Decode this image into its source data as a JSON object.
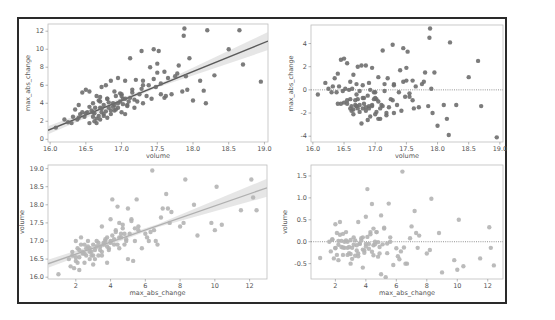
{
  "figure": {
    "frame_color": "#2a2a2a",
    "point_color_dark": "#6e6e6e",
    "point_color_light": "#b4b4b4",
    "line_color_dark": "#5a5a5a",
    "line_color_light": "#b0b0b0"
  },
  "chart_data": [
    {
      "id": "top-left",
      "type": "scatter",
      "subtype": "regplot",
      "xlabel": "volume",
      "ylabel": "max_abs_change",
      "xlim": [
        15.97,
        19.05
      ],
      "ylim": [
        -0.3,
        12.8
      ],
      "xticks": [
        16.0,
        16.5,
        17.0,
        17.5,
        18.0,
        18.5,
        19.0
      ],
      "xtick_labels": [
        "16.0",
        "16.5",
        "17.0",
        "17.5",
        "18.0",
        "18.5",
        "19.0"
      ],
      "yticks": [
        0,
        2,
        4,
        6,
        8,
        10,
        12
      ],
      "ytick_labels": [
        "0",
        "2",
        "4",
        "6",
        "8",
        "10",
        "12"
      ],
      "regression": {
        "x": [
          15.97,
          19.05
        ],
        "y": [
          1.0,
          10.9
        ],
        "ci": true
      },
      "points_x": [
        16.08,
        16.2,
        16.25,
        16.3,
        16.32,
        16.35,
        16.38,
        16.4,
        16.42,
        16.45,
        16.48,
        16.5,
        16.52,
        16.55,
        16.55,
        16.58,
        16.6,
        16.6,
        16.62,
        16.63,
        16.65,
        16.65,
        16.68,
        16.7,
        16.7,
        16.72,
        16.72,
        16.75,
        16.75,
        16.78,
        16.8,
        16.8,
        16.82,
        16.85,
        16.85,
        16.88,
        16.9,
        16.9,
        16.92,
        16.95,
        16.95,
        16.98,
        17.0,
        17.0,
        17.02,
        17.05,
        17.05,
        17.08,
        17.1,
        17.12,
        17.15,
        17.18,
        17.2,
        17.22,
        17.25,
        17.28,
        17.3,
        17.3,
        17.35,
        17.38,
        17.4,
        17.42,
        17.45,
        17.48,
        17.5,
        17.52,
        17.55,
        17.6,
        17.62,
        17.65,
        17.7,
        17.75,
        17.78,
        17.8,
        17.85,
        17.87,
        17.88,
        17.9,
        17.92,
        17.95,
        18.0,
        18.1,
        18.15,
        18.18,
        18.2,
        18.3,
        18.5,
        18.65,
        18.7,
        18.95,
        16.45,
        16.6,
        16.7,
        16.8,
        16.9,
        17.0,
        16.65,
        16.75,
        16.85,
        16.95,
        17.05,
        16.55,
        16.62,
        16.72,
        16.82,
        16.92,
        17.02,
        17.12,
        16.68,
        16.78,
        16.88,
        16.98,
        17.08,
        17.18,
        17.28,
        16.4,
        16.5,
        16.7,
        17.15,
        17.3,
        17.45,
        17.5,
        17.55,
        17.6
      ],
      "points_y": [
        1.3,
        2.2,
        1.9,
        1.8,
        2.5,
        3.3,
        2.2,
        3.8,
        2.8,
        5.2,
        2.5,
        5.5,
        3.0,
        1.8,
        5.3,
        3.2,
        2.5,
        4.0,
        2.0,
        3.5,
        1.8,
        4.8,
        2.6,
        2.2,
        4.2,
        5.8,
        3.0,
        2.6,
        3.8,
        6.0,
        2.4,
        4.5,
        3.5,
        2.8,
        6.5,
        4.0,
        3.2,
        5.3,
        4.8,
        3.5,
        6.8,
        4.2,
        3.0,
        5.0,
        4.5,
        2.8,
        6.5,
        3.8,
        4.2,
        9.0,
        5.5,
        3.5,
        6.6,
        4.2,
        5.0,
        9.8,
        4.0,
        6.5,
        4.8,
        6.0,
        8.0,
        4.5,
        10.0,
        5.8,
        8.4,
        9.8,
        6.2,
        7.5,
        4.8,
        6.8,
        5.0,
        7.0,
        7.3,
        8.2,
        5.3,
        11.5,
        12.3,
        7.0,
        5.5,
        9.0,
        4.3,
        6.5,
        5.4,
        4.0,
        12.1,
        7.1,
        10.0,
        12.1,
        8.3,
        6.4,
        3.0,
        3.0,
        3.5,
        4.5,
        3.8,
        4.8,
        2.3,
        2.8,
        3.2,
        4.0,
        4.5,
        3.6,
        2.9,
        3.4,
        4.1,
        3.3,
        3.9,
        4.6,
        4.3,
        3.1,
        3.6,
        5.1,
        3.7,
        4.4,
        5.6,
        2.4,
        2.9,
        4.7,
        5.2,
        6.0,
        6.7,
        7.4,
        5.0,
        4.6
      ]
    },
    {
      "id": "top-right",
      "type": "scatter",
      "subtype": "residplot",
      "xlabel": "volume",
      "ylabel": "max_abs_change",
      "xlim": [
        15.97,
        19.05
      ],
      "ylim": [
        -4.5,
        5.6
      ],
      "xticks": [
        16.0,
        16.5,
        17.0,
        17.5,
        18.0,
        18.5,
        19.0
      ],
      "xtick_labels": [
        "16.0",
        "16.5",
        "17.0",
        "17.5",
        "18.0",
        "18.5",
        "19.0"
      ],
      "yticks": [
        -4,
        -2,
        0,
        2,
        4
      ],
      "ytick_labels": [
        "-4",
        "-2",
        "0",
        "2",
        "4"
      ],
      "zero_line": 0,
      "points_x": [
        16.08,
        16.2,
        16.25,
        16.3,
        16.32,
        16.35,
        16.38,
        16.4,
        16.42,
        16.45,
        16.48,
        16.5,
        16.52,
        16.55,
        16.55,
        16.58,
        16.6,
        16.6,
        16.62,
        16.63,
        16.65,
        16.65,
        16.68,
        16.7,
        16.7,
        16.72,
        16.72,
        16.75,
        16.75,
        16.78,
        16.8,
        16.8,
        16.82,
        16.85,
        16.85,
        16.88,
        16.9,
        16.9,
        16.92,
        16.95,
        16.95,
        16.98,
        17.0,
        17.0,
        17.02,
        17.05,
        17.05,
        17.08,
        17.1,
        17.12,
        17.15,
        17.18,
        17.2,
        17.22,
        17.25,
        17.28,
        17.3,
        17.3,
        17.35,
        17.38,
        17.4,
        17.42,
        17.45,
        17.48,
        17.5,
        17.52,
        17.55,
        17.6,
        17.62,
        17.65,
        17.7,
        17.75,
        17.78,
        17.8,
        17.85,
        17.87,
        17.88,
        17.9,
        17.92,
        17.95,
        18.0,
        18.1,
        18.15,
        18.18,
        18.2,
        18.3,
        18.5,
        18.65,
        18.7,
        18.95,
        16.45,
        16.6,
        16.7,
        16.8,
        16.9,
        17.0,
        16.65,
        16.75,
        16.85,
        16.95,
        17.05,
        16.55,
        16.62,
        16.72,
        16.82,
        16.92,
        17.02,
        17.12,
        16.68,
        16.78,
        16.88,
        16.98,
        17.08,
        17.18,
        17.28,
        16.4,
        16.5,
        16.7,
        17.15,
        17.3,
        17.45,
        17.5,
        17.55,
        17.6
      ],
      "points_y": [
        -0.4,
        0.6,
        0.1,
        -0.2,
        0.3,
        1.0,
        -0.2,
        1.4,
        0.3,
        2.6,
        -0.1,
        2.7,
        0.1,
        -1.2,
        2.3,
        0.0,
        -0.8,
        0.7,
        -1.4,
        0.1,
        -1.7,
        1.3,
        -0.9,
        -1.4,
        0.5,
        2.0,
        -0.8,
        -1.3,
        -0.1,
        2.1,
        -1.6,
        0.4,
        -0.7,
        -1.5,
        2.1,
        -0.5,
        -1.4,
        0.6,
        0.0,
        -1.4,
        1.9,
        -0.8,
        -2.1,
        -0.2,
        -0.8,
        -2.5,
        1.1,
        -1.6,
        -1.3,
        3.4,
        -0.1,
        -2.2,
        1.0,
        -1.5,
        -0.8,
        3.9,
        -2.0,
        0.5,
        -1.3,
        -0.2,
        1.7,
        -1.8,
        3.6,
        -0.6,
        1.9,
        3.3,
        -0.3,
        0.8,
        -1.6,
        0.3,
        -1.5,
        0.5,
        0.7,
        1.5,
        -1.4,
        4.5,
        5.3,
        0.1,
        -2.0,
        1.5,
        -3.1,
        -1.3,
        -2.5,
        -3.9,
        4.1,
        -1.3,
        1.1,
        2.5,
        -1.4,
        -4.1,
        -1.2,
        -1.6,
        -1.4,
        -0.7,
        -1.6,
        -0.7,
        -2.1,
        -1.9,
        -1.8,
        -1.3,
        -1.0,
        -0.9,
        -1.8,
        -1.6,
        -1.2,
        -2.3,
        -1.9,
        -1.4,
        -1.3,
        -2.9,
        -2.6,
        -0.2,
        -2.5,
        -2.0,
        -0.9,
        -1.2,
        -1.1,
        -0.4,
        0.5,
        0.4,
        0.7,
        0.8,
        -0.6,
        -0.9
      ]
    },
    {
      "id": "bottom-left",
      "type": "scatter",
      "subtype": "regplot",
      "xlabel": "max_abs_change",
      "ylabel": "volume",
      "xlim": [
        0.4,
        13.0
      ],
      "ylim": [
        15.95,
        19.1
      ],
      "xticks": [
        2,
        4,
        6,
        8,
        10,
        12
      ],
      "xtick_labels": [
        "2",
        "4",
        "6",
        "8",
        "10",
        "12"
      ],
      "yticks": [
        16.0,
        16.5,
        17.0,
        17.5,
        18.0,
        18.5,
        19.0
      ],
      "ytick_labels": [
        "16.0",
        "16.5",
        "17.0",
        "17.5",
        "18.0",
        "18.5",
        "19.0"
      ],
      "regression": {
        "x": [
          0.4,
          13.0
        ],
        "y": [
          16.37,
          18.47
        ],
        "ci": true
      },
      "points_x": [
        1.0,
        1.6,
        1.7,
        1.8,
        1.9,
        2.0,
        2.0,
        2.1,
        2.2,
        2.2,
        2.3,
        2.4,
        2.5,
        2.5,
        2.6,
        2.7,
        2.8,
        2.8,
        2.9,
        3.0,
        3.0,
        3.1,
        3.2,
        3.3,
        3.4,
        3.5,
        3.5,
        3.6,
        3.7,
        3.8,
        3.8,
        3.9,
        4.0,
        4.0,
        4.1,
        4.2,
        4.3,
        4.4,
        4.5,
        4.5,
        4.6,
        4.7,
        4.8,
        4.9,
        5.0,
        5.0,
        5.1,
        5.2,
        5.3,
        5.4,
        5.5,
        5.6,
        5.8,
        6.0,
        6.2,
        6.4,
        6.5,
        6.7,
        7.0,
        7.2,
        7.4,
        7.5,
        8.0,
        8.2,
        8.3,
        8.8,
        9.0,
        9.8,
        10.0,
        10.1,
        10.4,
        11.5,
        12.1,
        12.2,
        12.4,
        1.8,
        2.0,
        2.2,
        2.4,
        2.6,
        2.8,
        3.0,
        3.2,
        3.4,
        3.6,
        3.8,
        4.0,
        4.2,
        4.4,
        4.6,
        4.8,
        2.1,
        2.3,
        2.5,
        2.7,
        2.9,
        3.1,
        3.3,
        3.5,
        3.7,
        3.9,
        4.1,
        4.3,
        4.5,
        4.7,
        4.9,
        5.2,
        5.6,
        6.1,
        6.3,
        6.6,
        6.9,
        7.3,
        5.4
      ],
      "points_y": [
        16.08,
        16.5,
        16.3,
        16.6,
        16.25,
        17.0,
        16.45,
        16.8,
        16.55,
        16.2,
        17.1,
        16.7,
        16.4,
        16.9,
        16.6,
        17.0,
        16.5,
        16.8,
        16.7,
        16.35,
        16.9,
        16.75,
        17.0,
        16.6,
        16.85,
        17.4,
        16.7,
        16.9,
        17.0,
        16.4,
        17.1,
        16.8,
        17.6,
        17.0,
        18.15,
        16.9,
        17.3,
        17.95,
        17.1,
        17.5,
        17.2,
        17.45,
        16.9,
        17.0,
        17.9,
        16.5,
        17.2,
        17.6,
        16.45,
        17.0,
        18.15,
        17.3,
        16.8,
        17.2,
        17.0,
        18.95,
        17.3,
        16.9,
        17.9,
        18.3,
        17.5,
        17.8,
        17.4,
        17.5,
        18.7,
        18.0,
        17.15,
        17.5,
        17.3,
        18.5,
        17.45,
        17.85,
        18.7,
        18.2,
        17.85,
        16.7,
        16.55,
        16.75,
        16.65,
        16.8,
        16.7,
        16.6,
        16.85,
        16.75,
        16.95,
        16.85,
        16.95,
        17.05,
        16.9,
        17.1,
        17.2,
        16.4,
        16.9,
        16.65,
        16.85,
        16.6,
        16.5,
        16.95,
        16.6,
        17.05,
        16.75,
        17.15,
        17.25,
        16.8,
        17.35,
        17.05,
        17.55,
        17.4,
        17.1,
        17.25,
        17.0,
        17.65,
        17.9,
        17.35
      ]
    },
    {
      "id": "bottom-right",
      "type": "scatter",
      "subtype": "residplot",
      "xlabel": "max_abs_change",
      "ylabel": "volume",
      "xlim": [
        0.4,
        13.0
      ],
      "ylim": [
        -0.85,
        1.75
      ],
      "xticks": [
        2,
        4,
        6,
        8,
        10,
        12
      ],
      "xtick_labels": [
        "2",
        "4",
        "6",
        "8",
        "10",
        "12"
      ],
      "yticks": [
        -0.5,
        0.0,
        0.5,
        1.0,
        1.5
      ],
      "ytick_labels": [
        "-0.5",
        "0.0",
        "0.5",
        "1.0",
        "1.5"
      ],
      "zero_line": 0,
      "points_x": [
        1.0,
        1.6,
        1.7,
        1.8,
        1.9,
        2.0,
        2.0,
        2.1,
        2.2,
        2.2,
        2.3,
        2.4,
        2.5,
        2.5,
        2.6,
        2.7,
        2.8,
        2.8,
        2.9,
        3.0,
        3.0,
        3.1,
        3.2,
        3.3,
        3.4,
        3.5,
        3.5,
        3.6,
        3.7,
        3.8,
        3.8,
        3.9,
        4.0,
        4.0,
        4.1,
        4.2,
        4.3,
        4.4,
        4.5,
        4.5,
        4.6,
        4.7,
        4.8,
        4.9,
        5.0,
        5.0,
        5.1,
        5.2,
        5.3,
        5.4,
        5.5,
        5.6,
        5.8,
        6.0,
        6.2,
        6.4,
        6.5,
        6.7,
        7.0,
        7.2,
        7.4,
        7.5,
        8.0,
        8.2,
        8.3,
        8.8,
        9.0,
        9.8,
        10.0,
        10.1,
        10.4,
        11.5,
        12.1,
        12.2,
        12.4,
        1.8,
        2.0,
        2.2,
        2.4,
        2.6,
        2.8,
        3.0,
        3.2,
        3.4,
        3.6,
        3.8,
        4.0,
        4.2,
        4.4,
        4.6,
        4.8,
        2.1,
        2.3,
        2.5,
        2.7,
        2.9,
        3.1,
        3.3,
        3.5,
        3.7,
        3.9,
        4.1,
        4.3,
        4.5,
        4.7,
        4.9,
        5.2,
        5.6,
        6.1,
        6.3,
        6.6,
        6.9,
        7.3,
        5.4
      ],
      "points_y": [
        -0.37,
        0.0,
        -0.22,
        0.05,
        -0.38,
        0.4,
        -0.15,
        0.2,
        -0.07,
        -0.42,
        0.45,
        0.02,
        -0.3,
        0.18,
        -0.14,
        0.22,
        -0.3,
        0.0,
        -0.12,
        -0.5,
        0.04,
        -0.14,
        0.1,
        -0.32,
        -0.08,
        0.45,
        -0.27,
        -0.05,
        0.03,
        -0.59,
        0.1,
        -0.2,
        0.57,
        -0.05,
        1.2,
        -0.16,
        0.22,
        0.86,
        -0.08,
        0.3,
        0.0,
        0.22,
        -0.34,
        -0.27,
        0.6,
        -0.74,
        -0.06,
        0.3,
        -0.81,
        -0.26,
        0.87,
        0.0,
        -0.53,
        -0.15,
        -0.4,
        1.6,
        -0.13,
        -0.5,
        0.35,
        0.7,
        -0.14,
        0.14,
        -0.27,
        -0.19,
        0.98,
        0.2,
        -0.7,
        -0.42,
        -0.64,
        0.5,
        -0.56,
        -0.38,
        0.33,
        -0.14,
        -0.54,
        0.05,
        -0.14,
        0.02,
        -0.12,
        0.0,
        -0.14,
        -0.28,
        -0.07,
        -0.2,
        -0.04,
        -0.18,
        -0.11,
        -0.05,
        -0.23,
        -0.06,
        -0.01,
        -0.3,
        0.16,
        -0.13,
        0.03,
        -0.26,
        -0.39,
        0.03,
        -0.33,
        0.08,
        -0.25,
        0.11,
        0.17,
        -0.31,
        0.22,
        -0.12,
        0.32,
        0.1,
        -0.33,
        -0.22,
        -0.5,
        0.08,
        0.2,
        -0.04
      ]
    }
  ]
}
